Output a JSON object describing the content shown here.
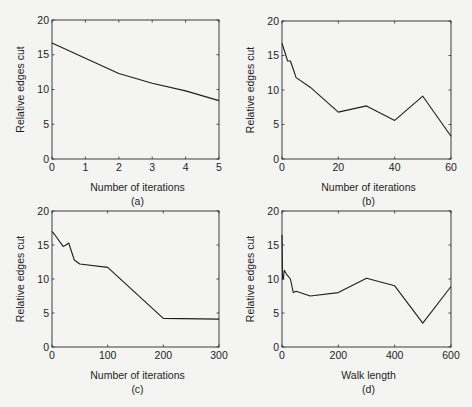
{
  "figure": {
    "background": "#f4f4f2",
    "line_color": "#1e1e1e",
    "axes_color": "#2a2a2a"
  },
  "chart_data": [
    {
      "type": "line",
      "panel": "(a)",
      "title": "",
      "xlabel": "Number of iterations",
      "ylabel": "Relative edges cut",
      "xlim": [
        0,
        5
      ],
      "ylim": [
        0,
        20
      ],
      "xticks": [
        0,
        1,
        2,
        3,
        4,
        5
      ],
      "yticks": [
        0,
        5,
        10,
        15,
        20
      ],
      "grid": false,
      "legend": null,
      "x": [
        0,
        1,
        2,
        3,
        4,
        5
      ],
      "series": [
        {
          "name": "",
          "values": [
            16.7,
            14.5,
            12.3,
            10.9,
            9.8,
            8.4
          ]
        }
      ]
    },
    {
      "type": "line",
      "panel": "(b)",
      "title": "",
      "xlabel": "Number of iterations",
      "ylabel": "Relative edges cut",
      "xlim": [
        0,
        60
      ],
      "ylim": [
        0,
        20
      ],
      "xticks": [
        0,
        20,
        40,
        60
      ],
      "yticks": [
        0,
        5,
        10,
        15,
        20
      ],
      "grid": false,
      "legend": null,
      "x": [
        0,
        1,
        2,
        3,
        4,
        5,
        10,
        20,
        30,
        40,
        50,
        60
      ],
      "series": [
        {
          "name": "",
          "values": [
            16.8,
            15.5,
            14.2,
            14.2,
            13.0,
            11.8,
            10.4,
            6.8,
            7.7,
            5.6,
            9.1,
            3.3
          ]
        }
      ]
    },
    {
      "type": "line",
      "panel": "(c)",
      "title": "",
      "xlabel": "Number of iterations",
      "ylabel": "Relative edges cut",
      "xlim": [
        0,
        300
      ],
      "ylim": [
        0,
        20
      ],
      "xticks": [
        0,
        100,
        200,
        300
      ],
      "yticks": [
        0,
        5,
        10,
        15,
        20
      ],
      "grid": false,
      "legend": null,
      "x": [
        0,
        5,
        20,
        25,
        30,
        40,
        50,
        100,
        200,
        300
      ],
      "series": [
        {
          "name": "",
          "values": [
            17.0,
            16.5,
            14.8,
            15.0,
            15.3,
            12.8,
            12.2,
            11.7,
            4.2,
            4.1
          ]
        }
      ]
    },
    {
      "type": "line",
      "panel": "(d)",
      "title": "",
      "xlabel": "Walk length",
      "ylabel": "Relative edges cut",
      "xlim": [
        0,
        600
      ],
      "ylim": [
        0,
        20
      ],
      "xticks": [
        0,
        200,
        400,
        600
      ],
      "yticks": [
        0,
        5,
        10,
        15,
        20
      ],
      "grid": false,
      "legend": null,
      "x": [
        0,
        2,
        5,
        8,
        15,
        20,
        30,
        40,
        50,
        100,
        200,
        300,
        400,
        500,
        600
      ],
      "series": [
        {
          "name": "",
          "values": [
            16.5,
            10.0,
            10.0,
            11.3,
            10.8,
            10.5,
            10.0,
            8.0,
            8.2,
            7.5,
            8.0,
            10.1,
            9.0,
            3.5,
            8.9
          ]
        }
      ]
    }
  ],
  "panels": [
    {
      "id": "a",
      "caption": "(a)",
      "xlabel": "Number of iterations",
      "ylabel": "Relative edges cut",
      "xtick_labels": [
        "0",
        "1",
        "2",
        "3",
        "4",
        "5"
      ],
      "ytick_labels": [
        "0",
        "5",
        "10",
        "15",
        "20"
      ]
    },
    {
      "id": "b",
      "caption": "(b)",
      "xlabel": "Number of iterations",
      "ylabel": "Relative edges cut",
      "xtick_labels": [
        "0",
        "20",
        "40",
        "60"
      ],
      "ytick_labels": [
        "0",
        "5",
        "10",
        "15",
        "20"
      ]
    },
    {
      "id": "c",
      "caption": "(c)",
      "xlabel": "Number of iterations",
      "ylabel": "Relative edges cut",
      "xtick_labels": [
        "0",
        "100",
        "200",
        "300"
      ],
      "ytick_labels": [
        "0",
        "5",
        "10",
        "15",
        "20"
      ]
    },
    {
      "id": "d",
      "caption": "(d)",
      "xlabel": "Walk length",
      "ylabel": "Relative edges cut",
      "xtick_labels": [
        "0",
        "200",
        "400",
        "600"
      ],
      "ytick_labels": [
        "0",
        "5",
        "10",
        "15",
        "20"
      ]
    }
  ]
}
